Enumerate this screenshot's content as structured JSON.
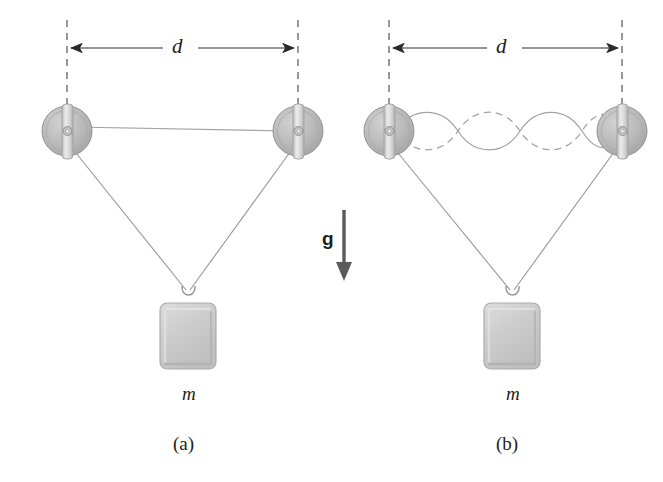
{
  "figure": {
    "background_color": "#ffffff",
    "ink_color": "#1d1d1d",
    "line_color": "#9a9a9a",
    "pulley_fill": "#b9b9b9",
    "pulley_edge": "#8f8f8f",
    "block_fill": "#cfcfcf",
    "block_edge": "#a8a8a8",
    "arrow_color": "#5a5a5a"
  },
  "panels": [
    {
      "id": "a",
      "caption": "(a)",
      "dimension_label": "d",
      "mass_label": "m",
      "string_state": "straight",
      "pulley_left": {
        "cx": 67,
        "cy": 131,
        "r": 25
      },
      "pulley_right": {
        "cx": 298,
        "cy": 131,
        "r": 25
      },
      "block": {
        "x": 160,
        "y": 303,
        "w": 56,
        "h": 66
      }
    },
    {
      "id": "b",
      "caption": "(b)",
      "dimension_label": "d",
      "mass_label": "m",
      "string_state": "standing-wave",
      "harmonic_number": 2,
      "antinodes": 2,
      "nodes": 3,
      "pulley_left": {
        "cx": 389,
        "cy": 131,
        "r": 25
      },
      "pulley_right": {
        "cx": 622,
        "cy": 131,
        "r": 25
      },
      "block": {
        "x": 484,
        "y": 303,
        "w": 56,
        "h": 66
      }
    }
  ],
  "gravity": {
    "label": "g",
    "direction": "down",
    "arrow_x": 344,
    "arrow_top": 210,
    "arrow_bottom": 279
  },
  "labels": {
    "distance": "d",
    "mass": "m",
    "gravity": "g",
    "panel_a": "(a)",
    "panel_b": "(b)"
  }
}
